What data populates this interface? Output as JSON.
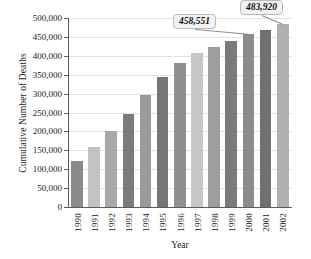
{
  "chart_data": {
    "type": "bar",
    "title": "",
    "xlabel": "Year",
    "ylabel": "Cumulative Number of Deaths",
    "categories": [
      "1990",
      "1991",
      "1992",
      "1993",
      "1994",
      "1995",
      "1996",
      "1997",
      "1998",
      "1999",
      "2000",
      "2001",
      "2002"
    ],
    "values": [
      122000,
      158000,
      201000,
      246000,
      296000,
      345000,
      380000,
      407000,
      424000,
      440000,
      458551,
      468000,
      483920
    ],
    "ylim": [
      0,
      500000
    ],
    "ytick_values": [
      0,
      50000,
      100000,
      150000,
      200000,
      250000,
      300000,
      350000,
      400000,
      450000,
      500000
    ],
    "ytick_labels": [
      "0",
      "50,000",
      "100,000",
      "150,000",
      "200,000",
      "250,000",
      "300,000",
      "350,000",
      "400,000",
      "450,000",
      "500,000"
    ],
    "grid": true,
    "legend": "none",
    "bar_colors": [
      "#8a8a8a",
      "#c2c2c2",
      "#a8a8a8",
      "#7b7b7b",
      "#9a9a9a",
      "#767676",
      "#8f8f8f",
      "#c6c6c6",
      "#9e9e9e",
      "#7a7a7a",
      "#8c8c8c",
      "#707070",
      "#b0b0b0"
    ],
    "annotations": [
      {
        "label": "458,551",
        "category": "2000",
        "value": 458551
      },
      {
        "label": "483,920",
        "category": "2002",
        "value": 483920
      }
    ]
  },
  "colors": {
    "axis": "#5a5a5a",
    "grid": "#e2e2e2",
    "callout_bg": "#f2f2f2",
    "callout_border": "#b9b9b9",
    "text": "#1a1a1a"
  }
}
